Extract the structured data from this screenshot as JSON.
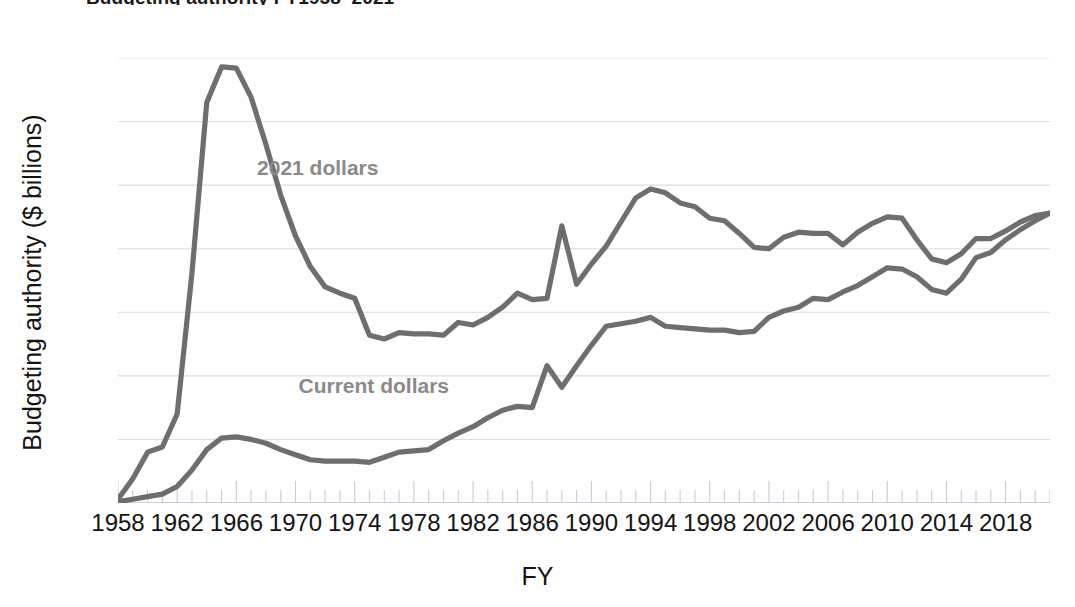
{
  "title_sliver": "Budgeting authority FY1958–2021",
  "axes": {
    "ylabel": "Budgeting authority ($ billions)",
    "xlabel": "FY",
    "yticks": [
      0,
      5,
      10,
      15,
      20,
      25,
      30,
      35
    ],
    "xticks": [
      1958,
      1962,
      1966,
      1970,
      1974,
      1978,
      1982,
      1986,
      1990,
      1994,
      1998,
      2002,
      2006,
      2010,
      2014,
      2018
    ]
  },
  "style": {
    "line_color": "#6e6e6e",
    "grid_color": "#d8dde6",
    "label_color": "#8a8a8a",
    "text_color": "#141414",
    "line_width": 5.2
  },
  "annotations": [
    {
      "text": "2021 dollars",
      "x": 1967.4,
      "y": 26.3
    },
    {
      "text": "Current dollars",
      "x": 1970.2,
      "y": 9.1
    }
  ],
  "chart_data": {
    "type": "line",
    "xlabel": "FY",
    "ylabel": "Budgeting authority ($ billions)",
    "xlim": [
      1958,
      2021
    ],
    "ylim": [
      0,
      35
    ],
    "grid": "horizontal",
    "legend": "inline-annotations",
    "x": [
      1958,
      1959,
      1960,
      1961,
      1962,
      1963,
      1964,
      1965,
      1966,
      1967,
      1968,
      1969,
      1970,
      1971,
      1972,
      1973,
      1974,
      1975,
      1976,
      1977,
      1978,
      1979,
      1980,
      1981,
      1982,
      1983,
      1984,
      1985,
      1986,
      1987,
      1988,
      1989,
      1990,
      1991,
      1992,
      1993,
      1994,
      1995,
      1996,
      1997,
      1998,
      1999,
      2000,
      2001,
      2002,
      2003,
      2004,
      2005,
      2006,
      2007,
      2008,
      2009,
      2010,
      2011,
      2012,
      2013,
      2014,
      2015,
      2016,
      2017,
      2018,
      2019,
      2020,
      2021
    ],
    "series": [
      {
        "name": "2021 dollars",
        "values": [
          0.3,
          1.9,
          4.0,
          4.4,
          7.0,
          18.1,
          31.5,
          34.3,
          34.2,
          31.9,
          28.2,
          24.2,
          21.0,
          18.6,
          17.0,
          16.5,
          16.1,
          13.2,
          12.9,
          13.4,
          13.3,
          13.3,
          13.2,
          14.2,
          14.0,
          14.6,
          15.4,
          16.5,
          16.0,
          16.1,
          21.8,
          17.2,
          18.8,
          20.2,
          22.1,
          24.0,
          24.7,
          24.4,
          23.6,
          23.3,
          22.4,
          22.2,
          21.2,
          20.1,
          20.0,
          20.9,
          21.3,
          21.2,
          21.2,
          20.3,
          21.3,
          22.0,
          22.5,
          22.4,
          20.7,
          19.2,
          18.9,
          19.6,
          20.8,
          20.8,
          21.4,
          22.1,
          22.6,
          22.8
        ]
      },
      {
        "name": "Current dollars",
        "values": [
          0.1,
          0.3,
          0.5,
          0.7,
          1.3,
          2.6,
          4.2,
          5.1,
          5.2,
          5.0,
          4.7,
          4.2,
          3.8,
          3.4,
          3.3,
          3.3,
          3.3,
          3.2,
          3.6,
          4.0,
          4.1,
          4.2,
          4.9,
          5.5,
          6.0,
          6.7,
          7.3,
          7.6,
          7.5,
          10.8,
          9.1,
          10.8,
          12.4,
          13.9,
          14.1,
          14.3,
          14.6,
          13.9,
          13.8,
          13.7,
          13.6,
          13.6,
          13.4,
          13.5,
          14.6,
          15.1,
          15.4,
          16.1,
          16.0,
          16.6,
          17.1,
          17.8,
          18.5,
          18.4,
          17.8,
          16.8,
          16.5,
          17.6,
          19.3,
          19.7,
          20.7,
          21.5,
          22.2,
          22.8
        ]
      }
    ]
  }
}
